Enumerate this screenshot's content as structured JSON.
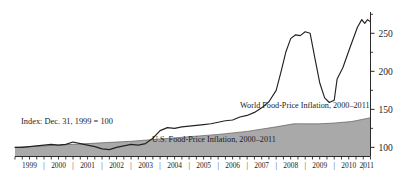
{
  "chart_data": {
    "type": "line",
    "title": "",
    "subtitle": "",
    "xlabel": "",
    "ylabel": "",
    "index_note": "Index: Dec. 31, 1999 = 100",
    "xlim": [
      1999.0,
      2011.25
    ],
    "ylim": [
      88,
      278
    ],
    "grid": false,
    "legend_position": "inline-annotations",
    "y_ticks_labeled": [
      100,
      150,
      200,
      250
    ],
    "y_ticks_minor": [
      125,
      175,
      225,
      275
    ],
    "y_tick_labels": [
      "100",
      "150",
      "200",
      "250"
    ],
    "x_tick_labels": [
      "1999",
      "2000",
      "2001",
      "2002",
      "2003",
      "2004",
      "2005",
      "2006",
      "2007",
      "2008",
      "2009",
      "2010",
      "2011"
    ],
    "x_tick_separator": "|",
    "x_minor_ticks_per_year": 4,
    "colors": {
      "world_line": "#232323",
      "us_area_fill": "#a9a9a9",
      "us_area_edge": "#5d5d5d",
      "axis": "#2a2a2a",
      "text": "#1b1b1b",
      "background": "#ffffff"
    },
    "series": [
      {
        "name": "World Food-Price Inflation, 2000–2011",
        "render": "line",
        "label_text": "World Food-Price Inflation, 2000–2011",
        "label_x": 2006.55,
        "label_y": 143,
        "x": [
          1999.0,
          1999.25,
          1999.5,
          1999.75,
          2000.0,
          2000.25,
          2000.5,
          2000.75,
          2001.0,
          2001.25,
          2001.5,
          2001.75,
          2002.0,
          2002.25,
          2002.5,
          2002.75,
          2003.0,
          2003.25,
          2003.5,
          2003.75,
          2004.0,
          2004.25,
          2004.5,
          2004.75,
          2005.0,
          2005.25,
          2005.5,
          2005.75,
          2006.0,
          2006.25,
          2006.5,
          2006.75,
          2007.0,
          2007.25,
          2007.5,
          2007.75,
          2008.0,
          2008.17,
          2008.33,
          2008.5,
          2008.67,
          2008.83,
          2009.0,
          2009.17,
          2009.33,
          2009.5,
          2009.67,
          2009.83,
          2010.0,
          2010.25,
          2010.5,
          2010.75,
          2011.0,
          2011.08,
          2011.17,
          2011.25
        ],
        "values": [
          100,
          100,
          101,
          102,
          103,
          104,
          103,
          104,
          107,
          105,
          103,
          101,
          98,
          97,
          100,
          102,
          104,
          103,
          105,
          112,
          122,
          126,
          125,
          127,
          128,
          129,
          130,
          131,
          133,
          135,
          136,
          140,
          142,
          146,
          152,
          160,
          175,
          200,
          225,
          243,
          248,
          247,
          252,
          250,
          218,
          185,
          165,
          159,
          162,
          173,
          178,
          190,
          201,
          196,
          191,
          190
        ],
        "extra_x": [
          2010.1,
          2010.3,
          2010.55,
          2010.8,
          2010.95,
          2011.05,
          2011.15,
          2011.25
        ],
        "extra_values": [
          190,
          205,
          232,
          258,
          268,
          263,
          268,
          265
        ],
        "peak_2008": 252,
        "trough_2008_late": 158,
        "peak_2011": 268
      },
      {
        "name": "U.S. Food-Price Inflation, 2000–2011",
        "render": "area",
        "label_text": "U.S. Food-Price Inflation, 2000–2011",
        "label_x": 2005.3,
        "label_y": 104,
        "x": [
          1999.0,
          2000.0,
          2001.0,
          2002.0,
          2003.0,
          2004.0,
          2005.0,
          2006.0,
          2007.0,
          2008.0,
          2008.6,
          2009.0,
          2009.5,
          2010.0,
          2010.6,
          2011.0,
          2011.25
        ],
        "values": [
          100,
          102,
          104,
          106,
          108,
          111,
          114,
          117,
          121,
          127,
          131,
          131,
          131,
          132,
          134,
          137,
          139
        ]
      }
    ]
  },
  "annotations": {
    "index_note": "Index: Dec. 31, 1999 = 100",
    "world_label": "World Food-Price Inflation, 2000–2011",
    "us_label": "U.S. Food-Price Inflation, 2000–2011"
  },
  "source_strip": {
    "text": ""
  }
}
